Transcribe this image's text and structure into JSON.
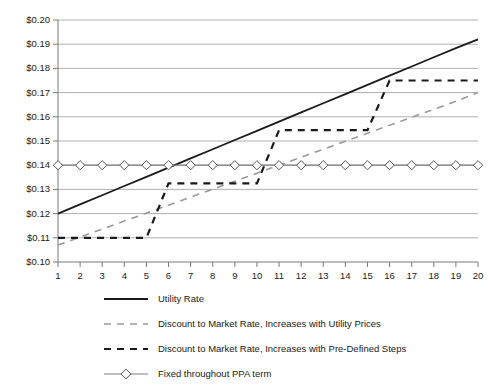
{
  "chart_data": {
    "type": "line",
    "title": "",
    "subtitle": "",
    "xlabel": "",
    "ylabel": "",
    "x": [
      1,
      2,
      3,
      4,
      5,
      6,
      7,
      8,
      9,
      10,
      11,
      12,
      13,
      14,
      15,
      16,
      17,
      18,
      19,
      20
    ],
    "xlim": [
      1,
      20
    ],
    "ylim": [
      0.1,
      0.2
    ],
    "grid": true,
    "grid_axis": "y",
    "legend_position": "bottom-left",
    "ytick_labels": [
      "$0.20",
      "$0.19",
      "$0.18",
      "$0.17",
      "$0.16",
      "$0.15",
      "$0.14",
      "$0.13",
      "$0.12",
      "$0.11",
      "$0.10"
    ],
    "ytick_values": [
      0.2,
      0.19,
      0.18,
      0.17,
      0.16,
      0.15,
      0.14,
      0.13,
      0.12,
      0.11,
      0.1
    ],
    "xtick_labels": [
      "1",
      "2",
      "3",
      "4",
      "5",
      "6",
      "7",
      "8",
      "9",
      "10",
      "11",
      "12",
      "13",
      "14",
      "15",
      "16",
      "17",
      "18",
      "19",
      "20"
    ],
    "series": [
      {
        "name": "Utility Rate",
        "style": "solid",
        "color": "#1a1a1a",
        "marker": "none",
        "values": [
          0.12,
          0.1238,
          0.1276,
          0.1314,
          0.1352,
          0.139,
          0.1428,
          0.1466,
          0.1504,
          0.1542,
          0.158,
          0.1618,
          0.1656,
          0.1694,
          0.1732,
          0.177,
          0.1808,
          0.1846,
          0.1884,
          0.192
        ]
      },
      {
        "name": "Discount to Market Rate, Increases with Utility Prices",
        "style": "dashed",
        "color": "#999999",
        "marker": "none",
        "values": [
          0.107,
          0.1103,
          0.1136,
          0.1169,
          0.1202,
          0.1235,
          0.1268,
          0.1301,
          0.1334,
          0.1367,
          0.14,
          0.1433,
          0.1466,
          0.1499,
          0.1532,
          0.1565,
          0.1598,
          0.1631,
          0.1664,
          0.17
        ]
      },
      {
        "name": "Discount to Market Rate, Increases with Pre-Defined Steps",
        "style": "dashed",
        "color": "#1a1a1a",
        "marker": "none",
        "values": [
          0.11,
          0.11,
          0.11,
          0.11,
          0.11,
          0.1325,
          0.1325,
          0.1325,
          0.1325,
          0.1325,
          0.1545,
          0.1545,
          0.1545,
          0.1545,
          0.1545,
          0.175,
          0.175,
          0.175,
          0.175,
          0.175
        ]
      },
      {
        "name": "Fixed throughout PPA term",
        "style": "solid",
        "color": "#808080",
        "marker": "diamond",
        "values": [
          0.14,
          0.14,
          0.14,
          0.14,
          0.14,
          0.14,
          0.14,
          0.14,
          0.14,
          0.14,
          0.14,
          0.14,
          0.14,
          0.14,
          0.14,
          0.14,
          0.14,
          0.14,
          0.14,
          0.14
        ]
      }
    ]
  },
  "legend": {
    "items": [
      {
        "label": "Utility Rate",
        "swatch": "solid-black-line"
      },
      {
        "label": "Discount to Market Rate, Increases with Utility Prices",
        "swatch": "dashed-gray-line"
      },
      {
        "label": "Discount to Market Rate, Increases with Pre-Defined Steps",
        "swatch": "dashed-black-line"
      },
      {
        "label": "Fixed throughout PPA term",
        "swatch": "diamond-marker-line"
      }
    ]
  },
  "colors": {
    "axis": "#7a7a7a",
    "grid": "#b0b0b0",
    "utility_rate": "#1a1a1a",
    "discount_utility": "#999999",
    "discount_steps": "#1a1a1a",
    "fixed_ppa": "#808080",
    "background": "#ffffff"
  }
}
